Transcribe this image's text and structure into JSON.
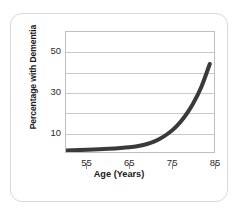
{
  "chart_data": {
    "type": "line",
    "title": "",
    "xlabel": "Age (Years)",
    "ylabel": "Percentage with Dementia",
    "xlim": [
      50,
      85
    ],
    "ylim": [
      0,
      60
    ],
    "xticks": [
      55,
      65,
      75,
      85
    ],
    "yticks": [
      10,
      30,
      50
    ],
    "ytick_labels": [
      "10",
      "30",
      "50"
    ],
    "xtick_labels": [
      "55",
      "65",
      "75",
      "85"
    ],
    "grid": "horizontal",
    "gridlines_y": [
      10,
      20,
      30,
      40,
      50
    ],
    "legend": "none",
    "series": [
      {
        "name": "Percentage with Dementia",
        "color": "#3a3a3a",
        "line_width": 4,
        "x": [
          50,
          55,
          60,
          65,
          68,
          70,
          72,
          74,
          76,
          78,
          80,
          82,
          84
        ],
        "values": [
          0.8,
          1.1,
          1.6,
          2.4,
          3.4,
          4.6,
          6.4,
          9.0,
          12.6,
          17.5,
          24.0,
          32.5,
          44.0
        ]
      }
    ]
  },
  "axes": {
    "y_title": "Percentage with Dementia",
    "x_title": "Age (Years)",
    "y_tick_labels": [
      {
        "label": "50",
        "value": 50
      },
      {
        "label": "30",
        "value": 30
      },
      {
        "label": "10",
        "value": 10
      }
    ],
    "x_tick_labels": [
      {
        "label": "55",
        "value": 55
      },
      {
        "label": "65",
        "value": 65
      },
      {
        "label": "75",
        "value": 75
      },
      {
        "label": "85",
        "value": 85
      }
    ]
  },
  "colors": {
    "curve": "#3a3a3a",
    "gridline": "#c9c9c9",
    "frame": "#bfbfbf",
    "card_border": "#d9d9d9",
    "text": "#1a1a1a",
    "background": "#ffffff"
  }
}
